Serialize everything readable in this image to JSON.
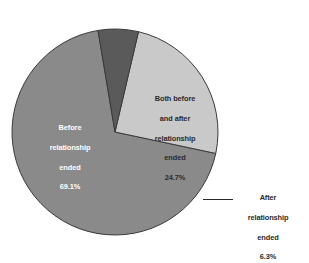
{
  "chart_data": {
    "type": "pie",
    "title": "",
    "subtitle": "",
    "xlabel": "",
    "ylabel": "",
    "legend_position": "none",
    "grid": false,
    "background_color": "#ffffff",
    "categories": [
      "Before relationship ended",
      "Both before and after relationship ended",
      "After relationship ended"
    ],
    "values": [
      69.1,
      24.7,
      6.3
    ],
    "value_suffix": "%",
    "slices": [
      {
        "name": "before",
        "label_lines": [
          "Before",
          "relationship",
          "ended",
          "69.1%"
        ],
        "label_text": "Before relationship ended 69.1%",
        "value": 69.1,
        "value_text": "69.1%",
        "color": "#8a8a8a",
        "text_color": "#ffffff",
        "label_placement": "inside",
        "start_angle_deg": 12,
        "end_angle_deg": 260.76
      },
      {
        "name": "both-before-and-after",
        "label_lines": [
          "Both before",
          "and after",
          "relationship",
          "ended",
          "24.7%"
        ],
        "label_text": "Both before and after relationship ended 24.7%",
        "value": 24.7,
        "value_text": "24.7%",
        "color": "#c9c9c9",
        "text_color": "#2b2b2b",
        "label_placement": "inside",
        "start_angle_deg": 300.68,
        "end_angle_deg": 12
      },
      {
        "name": "after",
        "label_lines": [
          "After",
          "relationship",
          "ended",
          "6.3%"
        ],
        "label_text": "After relationship ended 6.3%",
        "value": 6.3,
        "value_text": "6.3%",
        "color": "#5a5a5a",
        "text_color": "#2b2b2b",
        "label_placement": "outside",
        "has_leader_line": true,
        "start_angle_deg": 260.76,
        "end_angle_deg": 300.68
      }
    ],
    "outline_color": "#3a3a3a"
  }
}
